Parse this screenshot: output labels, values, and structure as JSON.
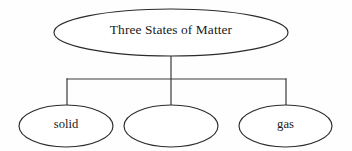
{
  "diagram": {
    "type": "hierarchy-tree",
    "title_text": "Three States of Matter",
    "background_color": "#fefefe",
    "stroke_color": "#2b2b2b",
    "connector_color": "#3a3a3a",
    "text_color": "#1a1a1a",
    "root": {
      "label": "Three States of Matter",
      "shape": "ellipse",
      "cx": 171,
      "cy": 32.5,
      "rx": 117,
      "ry": 23.5
    },
    "children": [
      {
        "label": "solid",
        "shape": "ellipse",
        "cx": 66,
        "cy": 126,
        "rx": 47,
        "ry": 21,
        "is_blank": false
      },
      {
        "label": "",
        "shape": "ellipse",
        "cx": 171,
        "cy": 126,
        "rx": 47,
        "ry": 21,
        "is_blank": true
      },
      {
        "label": "gas",
        "shape": "ellipse",
        "cx": 285.5,
        "cy": 126,
        "rx": 46.5,
        "ry": 21,
        "is_blank": false
      }
    ],
    "connectors": {
      "stem_x": 171,
      "stem_top_y": 56,
      "stem_bottom_y": 105,
      "bar_y": 79,
      "bar_left_x": 67,
      "bar_right_x": 286,
      "drop_left_x": 67,
      "drop_right_x": 286,
      "drop_bottom_y": 105
    }
  }
}
